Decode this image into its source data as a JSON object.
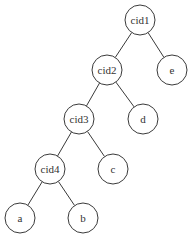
{
  "diagram": {
    "type": "binary-tree",
    "node_radius": 15,
    "stroke_color": "#3a3a3a",
    "nodes": [
      {
        "id": "cid1",
        "label": "cid1",
        "x": 140,
        "y": 20
      },
      {
        "id": "cid2",
        "label": "cid2",
        "x": 107,
        "y": 70
      },
      {
        "id": "e",
        "label": "e",
        "x": 172,
        "y": 70
      },
      {
        "id": "cid3",
        "label": "cid3",
        "x": 79,
        "y": 119
      },
      {
        "id": "d",
        "label": "d",
        "x": 143,
        "y": 119
      },
      {
        "id": "cid4",
        "label": "cid4",
        "x": 50,
        "y": 169
      },
      {
        "id": "c",
        "label": "c",
        "x": 113,
        "y": 169
      },
      {
        "id": "a",
        "label": "a",
        "x": 20,
        "y": 218
      },
      {
        "id": "b",
        "label": "b",
        "x": 83,
        "y": 218
      }
    ],
    "edges": [
      {
        "from": "cid1",
        "to": "cid2"
      },
      {
        "from": "cid1",
        "to": "e"
      },
      {
        "from": "cid2",
        "to": "cid3"
      },
      {
        "from": "cid2",
        "to": "d"
      },
      {
        "from": "cid3",
        "to": "cid4"
      },
      {
        "from": "cid3",
        "to": "c"
      },
      {
        "from": "cid4",
        "to": "a"
      },
      {
        "from": "cid4",
        "to": "b"
      }
    ]
  }
}
